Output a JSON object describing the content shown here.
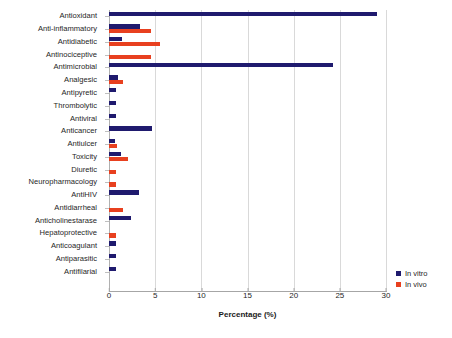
{
  "chart_data": {
    "type": "bar",
    "orientation": "horizontal",
    "title": "",
    "xlabel": "Percentage (%)",
    "ylabel": "",
    "xlim": [
      0,
      30
    ],
    "xticks": [
      0,
      5,
      10,
      15,
      20,
      25,
      30
    ],
    "grid": "vertical",
    "legend_position": "right-bottom",
    "categories": [
      "Antioxidant",
      "Anti-inflammatory",
      "Antidiabetic",
      "Antinociceptive",
      "Antimicrobial",
      "Analgesic",
      "Antipyretic",
      "Thrombolytic",
      "Antiviral",
      "Anticancer",
      "Antiulcer",
      "Toxicity",
      "Diuretic",
      "Neuropharmacology",
      "AntiHIV",
      "Antidiarrheal",
      "Anticholinestarase",
      "Hepatoprotective",
      "Anticoagulant",
      "Antiparasitic",
      "Antifilarial"
    ],
    "series": [
      {
        "name": "In vitro",
        "color": "#1f1a6e",
        "values": [
          29.0,
          3.4,
          1.4,
          0,
          24.3,
          1.0,
          0.8,
          0.8,
          0.8,
          4.7,
          0.7,
          1.3,
          0,
          0,
          3.2,
          0,
          2.4,
          0,
          0.8,
          0.8,
          0.8
        ]
      },
      {
        "name": "In vivo",
        "color": "#e8401f",
        "values": [
          0,
          4.6,
          5.5,
          4.6,
          0,
          1.5,
          0,
          0,
          0,
          0,
          0.9,
          2.1,
          0.8,
          0.8,
          0,
          1.5,
          0,
          0.8,
          0,
          0,
          0
        ]
      }
    ]
  },
  "legend": {
    "items": [
      {
        "label": "In vitro",
        "color": "#1f1a6e"
      },
      {
        "label": "In vivo",
        "color": "#e8401f"
      }
    ]
  }
}
